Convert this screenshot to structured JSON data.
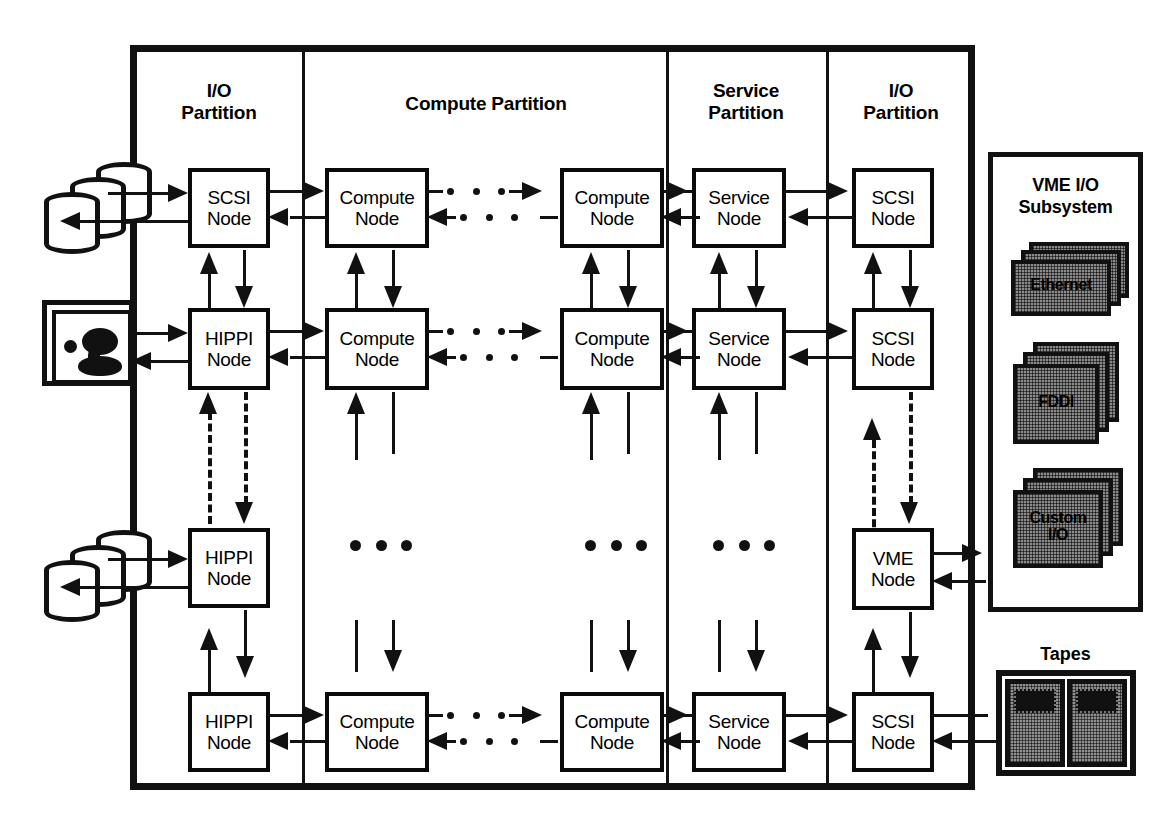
{
  "diagram": {
    "colors": {
      "ink": "#111111",
      "paper": "#ffffff",
      "card_fill": "#8a8a8a"
    }
  },
  "partitions": [
    {
      "id": "io-left",
      "label_line1": "I/O",
      "label_line2": "Partition"
    },
    {
      "id": "compute",
      "label_line1": "Compute Partition",
      "label_line2": ""
    },
    {
      "id": "service",
      "label_line1": "Service",
      "label_line2": "Partition"
    },
    {
      "id": "io-right",
      "label_line1": "I/O",
      "label_line2": "Partition"
    }
  ],
  "nodes": {
    "row1": [
      {
        "line1": "SCSI",
        "line2": "Node"
      },
      {
        "line1": "Compute",
        "line2": "Node"
      },
      {
        "line1": "Compute",
        "line2": "Node"
      },
      {
        "line1": "Service",
        "line2": "Node"
      },
      {
        "line1": "SCSI",
        "line2": "Node"
      }
    ],
    "row2": [
      {
        "line1": "HIPPI",
        "line2": "Node"
      },
      {
        "line1": "Compute",
        "line2": "Node"
      },
      {
        "line1": "Compute",
        "line2": "Node"
      },
      {
        "line1": "Service",
        "line2": "Node"
      },
      {
        "line1": "SCSI",
        "line2": "Node"
      }
    ],
    "row3": [
      {
        "line1": "HIPPI",
        "line2": "Node"
      },
      {
        "line1": "VME",
        "line2": "Node"
      }
    ],
    "row4": [
      {
        "line1": "HIPPI",
        "line2": "Node"
      },
      {
        "line1": "Compute",
        "line2": "Node"
      },
      {
        "line1": "Compute",
        "line2": "Node"
      },
      {
        "line1": "Service",
        "line2": "Node"
      },
      {
        "line1": "SCSI",
        "line2": "Node"
      }
    ]
  },
  "peripherals": {
    "disks_top": {
      "name": "disk-array",
      "count": 3
    },
    "workstation": {
      "name": "workstation-display"
    },
    "disks_bottom": {
      "name": "disk-array",
      "count": 3
    },
    "vme_subsystem": {
      "title_line1": "VME I/O",
      "title_line2": "Subsystem",
      "cards": [
        {
          "label_line1": "Ethernet",
          "label_line2": "",
          "count": 3
        },
        {
          "label_line1": "FDDI",
          "label_line2": "",
          "count": 3
        },
        {
          "label_line1": "Custom",
          "label_line2": "I/O",
          "count": 3
        }
      ]
    },
    "tapes": {
      "title": "Tapes",
      "count": 2
    }
  },
  "ellipsis": {
    "glyph": "•••"
  }
}
